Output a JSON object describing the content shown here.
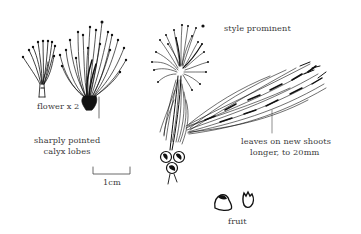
{
  "figure": {
    "background": "#ffffff",
    "ink_color": "#111111",
    "text_color": "#3a3a3a"
  },
  "labels": {
    "flower": "flower x 2",
    "calyx_line1": "sharply pointed",
    "calyx_line2": "calyx lobes",
    "scale": "1cm",
    "style": "style prominent",
    "leaves_line1": "leaves on new shoots",
    "leaves_line2": "longer, to 20mm",
    "fruit": "fruit"
  },
  "drawings": [
    {
      "name": "small-flower-bud",
      "desc": "small flower with few stamens"
    },
    {
      "name": "flower-x2",
      "desc": "enlarged open flower with many stamens"
    },
    {
      "name": "flowering-branch",
      "desc": "shoot with terminal flower head and fruits at base"
    },
    {
      "name": "leafy-shoot",
      "desc": "spray of long narrow leaves"
    },
    {
      "name": "fruit-pair",
      "desc": "two small fruits"
    }
  ],
  "scale_bar": {
    "length_label": "1cm"
  }
}
